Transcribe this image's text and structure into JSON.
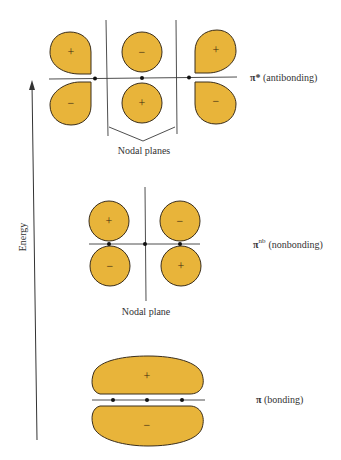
{
  "diagram": {
    "axis": {
      "label": "Energy",
      "direction": "up"
    },
    "levels": [
      {
        "id": "antibonding",
        "label_symbol": "π*",
        "label_text": "(antibonding)",
        "lobes_upper": [
          "+",
          "−",
          "+"
        ],
        "lobes_lower": [
          "−",
          "+",
          "−"
        ],
        "node_caption": "Nodal planes",
        "nodal_plane_count": 2
      },
      {
        "id": "nonbonding",
        "label_symbol": "π",
        "label_superscript": "nb",
        "label_text": "(nonbonding)",
        "lobes_upper": [
          "+",
          "−"
        ],
        "lobes_lower": [
          "−",
          "+"
        ],
        "node_caption": "Nodal plane",
        "nodal_plane_count": 1
      },
      {
        "id": "bonding",
        "label_symbol": "π",
        "label_text": "(bonding)",
        "lobes_upper": [
          "+"
        ],
        "lobes_lower": [
          "−"
        ],
        "nodal_plane_count": 0
      }
    ],
    "colors": {
      "lobe_fill": "#e8b43a",
      "lobe_stroke": "#3a2e1c",
      "line": "#3a3a3a"
    }
  }
}
